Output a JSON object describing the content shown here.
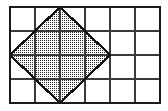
{
  "figure": {
    "title": "Shaded diamond inscribed in a rectangular grid",
    "type": "geometry-diagram",
    "canvas": {
      "width": 168,
      "height": 111,
      "background": "#ffffff"
    },
    "colors": {
      "grid_line": "#3a3a3a",
      "border_line": "#1a1a1a",
      "shape_outline": "#111111",
      "shape_fill_dot": "#2a2a2a",
      "shape_fill_background": "#ffffff",
      "page_background": "#ffffff"
    },
    "grid": {
      "label": "square grid",
      "columns": 6,
      "rows": 4,
      "cell_size": 25,
      "left": 10,
      "top": 7,
      "right": 160,
      "bottom": 103,
      "x_lines": [
        10,
        35,
        60,
        85,
        110,
        135,
        160
      ],
      "y_lines": [
        7,
        31,
        55,
        79,
        103
      ],
      "grid_line_width": 1.6,
      "border_line_width": 2.2
    },
    "shape": {
      "name": "diamond",
      "description": "rotated square (rhombus) with vertices on grid line intersections",
      "fill": "dotted-stipple",
      "outline_width": 2.2,
      "vertices": [
        {
          "name": "top",
          "x": 60,
          "y": 7
        },
        {
          "name": "right",
          "x": 110,
          "y": 55
        },
        {
          "name": "bottom",
          "x": 60,
          "y": 103
        },
        {
          "name": "left",
          "x": 10,
          "y": 55
        }
      ],
      "diagonal_horizontal_cells": 4,
      "diagonal_vertical_cells": 4
    },
    "stipple": {
      "pattern": "dot-grid",
      "spacing": 2,
      "dot_size": 1
    }
  }
}
